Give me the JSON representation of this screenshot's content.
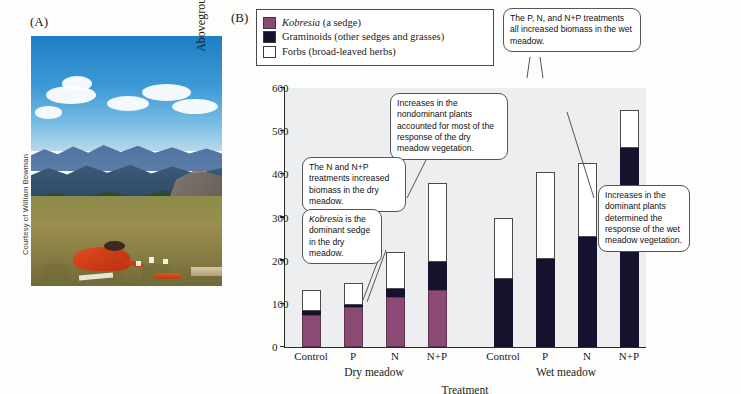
{
  "panel_a": {
    "label": "(A)",
    "credit": "Courtesy of William Bowman"
  },
  "panel_b": {
    "label": "(B)",
    "legend": [
      {
        "swatch": "kobresia-swatch",
        "color": "#8a4a73",
        "text_italic": "Kobresia",
        "text_rest": " (a sedge)"
      },
      {
        "swatch": "graminoids-swatch",
        "color": "#15122e",
        "text_italic": "",
        "text_rest": "Graminoids (other sedges and grasses)"
      },
      {
        "swatch": "forbs-swatch",
        "color": "#ffffff",
        "text_italic": "",
        "text_rest": "Forbs (broad-leaved herbs)"
      }
    ],
    "callouts": [
      {
        "name": "callout-wet-meadow-top",
        "text": "The P, N, and N+P treatments all increased biomass in the wet meadow."
      },
      {
        "name": "callout-nondominant-plants",
        "text": "Increases in the nondominant plants accounted for most of the response of the dry meadow vegetation."
      },
      {
        "name": "callout-n-np-dry-meadow",
        "text": "The N and N+P treatments increased biomass in the dry meadow."
      },
      {
        "name": "callout-kobresia-dominant",
        "text_italic": "Kobresia",
        "text_rest": " is the dominant sedge in the dry meadow."
      },
      {
        "name": "callout-dominant-plants-wet",
        "text": "Increases in the dominant plants determined the response of the wet meadow vegetation."
      }
    ]
  },
  "chart_data": {
    "type": "bar",
    "subtype": "stacked",
    "title": "",
    "xlabel": "Treatment",
    "ylabel": "Aboveground biomass (g/m²)",
    "ylim": [
      0,
      600
    ],
    "yticks": [
      0,
      100,
      200,
      300,
      400,
      500,
      600
    ],
    "grid": false,
    "legend_position": "top-left-outside",
    "categories": [
      "Control",
      "P",
      "N",
      "N+P",
      "Control",
      "P",
      "N",
      "N+P"
    ],
    "groups": [
      {
        "name": "Dry meadow",
        "categories": [
          "Control",
          "P",
          "N",
          "N+P"
        ]
      },
      {
        "name": "Wet meadow",
        "categories": [
          "Control",
          "P",
          "N",
          "N+P"
        ]
      }
    ],
    "series": [
      {
        "name": "Kobresia (a sedge)",
        "color": "#8a4a73",
        "values": [
          75,
          93,
          116,
          131,
          0,
          0,
          0,
          0
        ]
      },
      {
        "name": "Graminoids (other sedges and grasses)",
        "color": "#15122e",
        "values": [
          8,
          5,
          19,
          65,
          157,
          205,
          254,
          461
        ]
      },
      {
        "name": "Forbs (broad-leaved herbs)",
        "color": "#ffffff",
        "values": [
          49,
          51,
          84,
          183,
          143,
          200,
          172,
          89
        ]
      }
    ],
    "totals": [
      132,
      149,
      219,
      379,
      300,
      405,
      426,
      550
    ]
  }
}
